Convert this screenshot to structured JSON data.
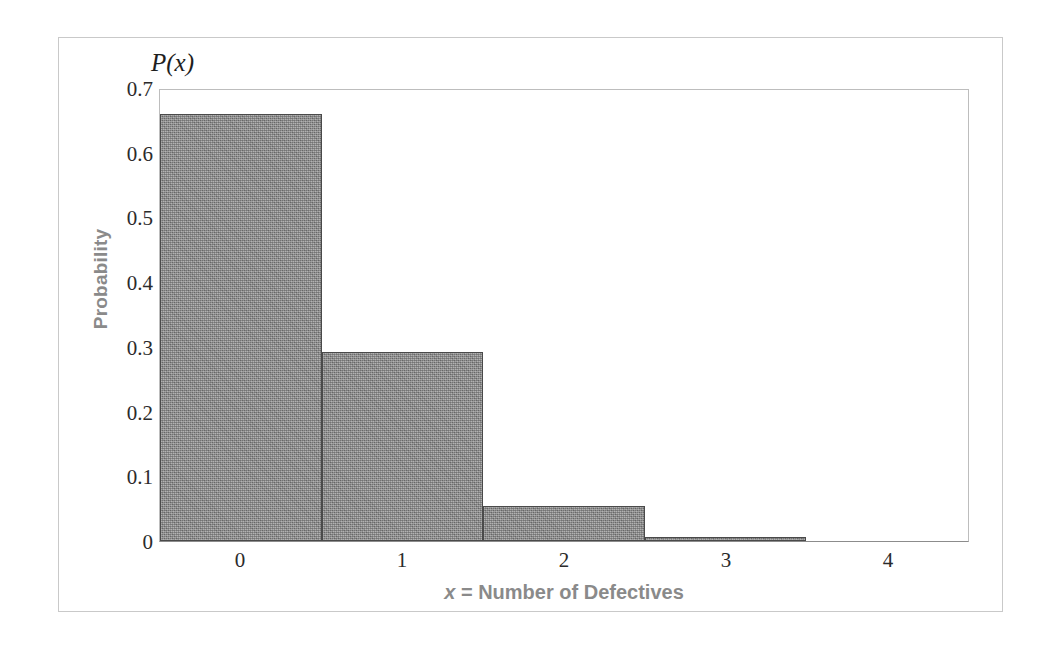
{
  "figure": {
    "annotation_label": "P(x)",
    "frame_color": "#c9c9c9",
    "bar_fill_color": "#8d8d8d",
    "bar_edge_color": "#4a4a4a",
    "axis_title_color": "#8a8a8a",
    "tick_label_color": "#2b2b2b"
  },
  "chart_data": {
    "type": "bar",
    "title": "",
    "subtitle": "",
    "xlabel": "x = Number of Defectives",
    "xlabel_italic_part": "x",
    "xlabel_rest": " = Number of Defectives",
    "ylabel": "Probability",
    "annotation": "P(x)",
    "categories": [
      "0",
      "1",
      "2",
      "3",
      "4"
    ],
    "values": [
      0.663,
      0.294,
      0.054,
      0.005,
      0.0
    ],
    "xlim": [
      -0.5,
      4.5
    ],
    "ylim": [
      0,
      0.7
    ],
    "ytick_labels": [
      "0.7",
      "0.6",
      "0.5",
      "0.4",
      "0.3",
      "0.2",
      "0.1",
      "0"
    ],
    "ytick_values": [
      0.7,
      0.6,
      0.5,
      0.4,
      0.3,
      0.2,
      0.1,
      0
    ],
    "xtick_labels": [
      "0",
      "1",
      "2",
      "3",
      "4"
    ],
    "grid": false,
    "legend": null,
    "bar_gap": 0
  }
}
